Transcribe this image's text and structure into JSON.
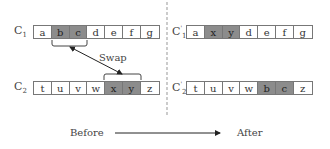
{
  "before": {
    "c1": {
      "label": "C",
      "sub": "1",
      "cells": [
        "a",
        "b",
        "c",
        "d",
        "e",
        "f",
        "g"
      ],
      "highlight": [
        1,
        2
      ]
    },
    "c2": {
      "label": "C",
      "sub": "2",
      "cells": [
        "t",
        "u",
        "v",
        "w",
        "x",
        "y",
        "z"
      ],
      "highlight": [
        4,
        5
      ]
    }
  },
  "after": {
    "c1": {
      "label": "C",
      "sup": "'",
      "sub": "1",
      "cells": [
        "a",
        "x",
        "y",
        "d",
        "e",
        "f",
        "g"
      ],
      "highlight": [
        1,
        2
      ]
    },
    "c2": {
      "label": "C",
      "sup": "'",
      "sub": "2",
      "cells": [
        "t",
        "u",
        "v",
        "w",
        "b",
        "c",
        "z"
      ],
      "highlight": [
        4,
        5
      ]
    }
  },
  "swap_label": "Swap",
  "before_label": "Before",
  "after_label": "After",
  "colors": {
    "highlight": "#8c8c8c",
    "border": "#777777",
    "divider": "#aaaaaa"
  }
}
